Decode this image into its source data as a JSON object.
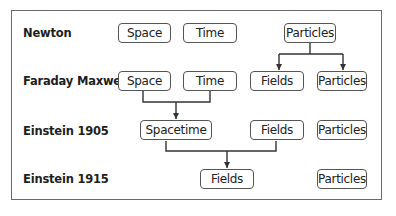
{
  "rows": [
    {
      "label": "Newton",
      "nodes": [
        "Space",
        "Time",
        "Particles"
      ]
    },
    {
      "label": "Faraday Maxwell",
      "nodes": [
        "Space",
        "Time",
        "Fields",
        "Particles"
      ]
    },
    {
      "label": "Einstein 1905",
      "nodes": [
        "Spacetime",
        "Fields",
        "Particles"
      ]
    },
    {
      "label": "Einstein 1915",
      "nodes": [
        "Fields",
        "Particles"
      ]
    }
  ],
  "edges": [
    {
      "from": "Newton.Particles",
      "to": [
        "Faraday Maxwell.Fields",
        "Faraday Maxwell.Particles"
      ]
    },
    {
      "from": [
        "Faraday Maxwell.Space",
        "Faraday Maxwell.Time"
      ],
      "to": "Einstein 1905.Spacetime"
    },
    {
      "from": [
        "Einstein 1905.Spacetime",
        "Einstein 1905.Fields"
      ],
      "to": "Einstein 1915.Fields"
    }
  ],
  "colors": {
    "line": "#333333",
    "border": "#555555",
    "frame": "#6a6a6a"
  }
}
